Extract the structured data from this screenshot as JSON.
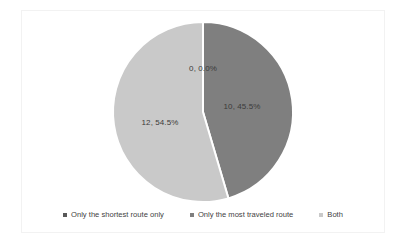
{
  "chart_data": {
    "type": "pie",
    "title": "",
    "subtitle": "",
    "xlabel": "",
    "ylabel": "",
    "grid": false,
    "legend_position": "bottom",
    "total": 22,
    "categories": [
      "Only the shortest route only",
      "Only the most traveled route",
      "Both"
    ],
    "values": [
      0,
      10,
      12
    ],
    "percentages": [
      "0.0%",
      "45.5%",
      "54.5%"
    ],
    "data_labels": [
      "0, 0.0%",
      "10, 45.5%",
      "12, 54.5%"
    ],
    "colors": [
      "#595959",
      "#7f7f7f",
      "#c9c9c9"
    ],
    "slices": [
      {
        "name": "Only the shortest route only",
        "value": 0,
        "percent": "0.0%",
        "label": "0, 0.0%",
        "color": "#595959",
        "start_angle": 0,
        "end_angle": 0,
        "label_x": 203,
        "label_y": 68
      },
      {
        "name": "Only the most traveled route",
        "value": 10,
        "percent": "45.5%",
        "label": "10, 45.5%",
        "color": "#7f7f7f",
        "start_angle": 0,
        "end_angle": 163.6,
        "label_x": 242,
        "label_y": 106
      },
      {
        "name": "Both",
        "value": 12,
        "percent": "54.5%",
        "label": "12, 54.5%",
        "color": "#c9c9c9",
        "start_angle": 163.6,
        "end_angle": 360,
        "label_x": 160,
        "label_y": 122
      }
    ],
    "geometry": {
      "center_x": 203,
      "center_y": 112,
      "radius": 90
    }
  },
  "legend": {
    "marker_icon": "square-marker-icon",
    "items": [
      {
        "label": "Only the shortest route only",
        "color": "#595959"
      },
      {
        "label": "Only the most traveled route",
        "color": "#7f7f7f"
      },
      {
        "label": "Both",
        "color": "#c9c9c9"
      }
    ]
  },
  "frame": {
    "border_color": "#f2f2f2",
    "background": "#ffffff"
  }
}
